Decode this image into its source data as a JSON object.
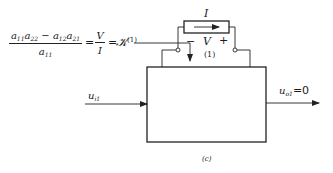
{
  "equation": {
    "numerator_terms": [
      {
        "base": "a",
        "sub": "11"
      },
      {
        "base": "a",
        "sub": "22"
      },
      {
        "op": "−"
      },
      {
        "base": "a",
        "sub": "12"
      },
      {
        "base": "a",
        "sub": "21"
      }
    ],
    "numerator_text": "a11a22 − a12a21",
    "denominator": {
      "base": "a",
      "sub": "11"
    },
    "eq1": "=",
    "ratio_num": "V",
    "ratio_den": "I",
    "eq2": "=",
    "symbol": "𝒦",
    "symbol_sup": "(1)"
  },
  "circuit": {
    "current_label": "I",
    "minus_label": "−",
    "voltage_label": "V",
    "plus_label": "+",
    "port_label": "(1)"
  },
  "input": {
    "base": "u",
    "sub": "i1"
  },
  "output": {
    "base": "u",
    "sub": "o1",
    "value": "=0"
  },
  "caption": "(c)"
}
